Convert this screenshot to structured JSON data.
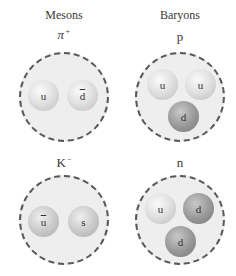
{
  "headings": {
    "mesons": "Mesons",
    "baryons": "Baryons"
  },
  "particles": [
    {
      "name": "pion-plus",
      "symbol": "π",
      "charge": "+",
      "category": "meson",
      "quarks": [
        {
          "label": "u",
          "antiquark": false,
          "shade": "light"
        },
        {
          "label": "d",
          "antiquark": true,
          "shade": "light"
        }
      ]
    },
    {
      "name": "proton",
      "symbol": "p",
      "charge": "",
      "category": "baryon",
      "quarks": [
        {
          "label": "u",
          "antiquark": false,
          "shade": "light"
        },
        {
          "label": "u",
          "antiquark": false,
          "shade": "light"
        },
        {
          "label": "d",
          "antiquark": false,
          "shade": "dark"
        }
      ]
    },
    {
      "name": "kaon-minus",
      "symbol": "K",
      "charge": "−",
      "category": "meson",
      "quarks": [
        {
          "label": "u",
          "antiquark": true,
          "shade": "mid"
        },
        {
          "label": "s",
          "antiquark": false,
          "shade": "mid"
        }
      ]
    },
    {
      "name": "neutron",
      "symbol": "n",
      "charge": "",
      "category": "baryon",
      "quarks": [
        {
          "label": "u",
          "antiquark": false,
          "shade": "light"
        },
        {
          "label": "d",
          "antiquark": false,
          "shade": "dark"
        },
        {
          "label": "d",
          "antiquark": false,
          "shade": "dark"
        }
      ]
    }
  ],
  "colors": {
    "hadron_fill": "#eeeeee",
    "hadron_border": "#5a5a5a",
    "quark_light": "#e2e2e2",
    "quark_mid": "#cfcfcf",
    "quark_dark": "#9b9b9b",
    "text": "#3a3a3a"
  }
}
